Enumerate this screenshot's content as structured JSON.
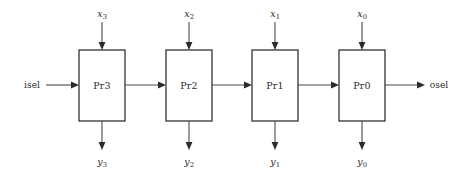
{
  "figure": {
    "kind": "block-diagram",
    "width": 467,
    "height": 176,
    "background_color": "#ffffff",
    "line_color": "#4a4a4a",
    "box_stroke_color": "#2b2b2b",
    "text_color": "#2b2b2b"
  },
  "chain_input": {
    "label": "isel",
    "x": 32,
    "y": 85
  },
  "chain_output": {
    "label": "osel",
    "x": 439,
    "y": 85
  },
  "stages": [
    {
      "label": "Pr3",
      "box": {
        "x": 79,
        "y": 50,
        "w": 46,
        "h": 71
      },
      "input_top": {
        "base": "x",
        "sub": "3",
        "label_x": 102,
        "label_y": 13
      },
      "output_bottom": {
        "base": "y",
        "sub": "3",
        "label_x": 102,
        "label_y": 161
      }
    },
    {
      "label": "Pr2",
      "box": {
        "x": 166,
        "y": 50,
        "w": 46,
        "h": 71
      },
      "input_top": {
        "base": "x",
        "sub": "2",
        "label_x": 189,
        "label_y": 13
      },
      "output_bottom": {
        "base": "y",
        "sub": "2",
        "label_x": 189,
        "label_y": 161
      }
    },
    {
      "label": "Pr1",
      "box": {
        "x": 252,
        "y": 50,
        "w": 46,
        "h": 71
      },
      "input_top": {
        "base": "x",
        "sub": "1",
        "label_x": 275,
        "label_y": 13
      },
      "output_bottom": {
        "base": "y",
        "sub": "1",
        "label_x": 275,
        "label_y": 161
      }
    },
    {
      "label": "Pr0",
      "box": {
        "x": 339,
        "y": 50,
        "w": 46,
        "h": 71
      },
      "input_top": {
        "base": "x",
        "sub": "0",
        "label_x": 362,
        "label_y": 13
      },
      "output_bottom": {
        "base": "y",
        "sub": "0",
        "label_x": 362,
        "label_y": 161
      }
    }
  ]
}
